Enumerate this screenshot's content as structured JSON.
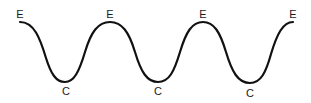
{
  "diagram": {
    "stroke_color": "#111111",
    "label_color": "#1a1a1a",
    "background": "#ffffff",
    "points": [
      {
        "id": "p1",
        "type": "crest",
        "label": "E",
        "x": 20,
        "y": 22
      },
      {
        "id": "p2",
        "type": "trough",
        "label": "C",
        "x": 65,
        "y": 82
      },
      {
        "id": "p3",
        "type": "crest",
        "label": "E",
        "x": 110,
        "y": 22
      },
      {
        "id": "p4",
        "type": "trough",
        "label": "C",
        "x": 158,
        "y": 82
      },
      {
        "id": "p5",
        "type": "crest",
        "label": "E",
        "x": 203,
        "y": 22
      },
      {
        "id": "p6",
        "type": "trough",
        "label": "C",
        "x": 250,
        "y": 83
      },
      {
        "id": "p7",
        "type": "crest",
        "label": "E",
        "x": 293,
        "y": 22
      }
    ],
    "labels": [
      {
        "text": "E",
        "x": 20,
        "y": 9
      },
      {
        "text": "C",
        "x": 66,
        "y": 86
      },
      {
        "text": "E",
        "x": 110,
        "y": 9
      },
      {
        "text": "C",
        "x": 158,
        "y": 86
      },
      {
        "text": "E",
        "x": 203,
        "y": 9
      },
      {
        "text": "C",
        "x": 250,
        "y": 88
      },
      {
        "text": "E",
        "x": 293,
        "y": 9
      }
    ]
  }
}
